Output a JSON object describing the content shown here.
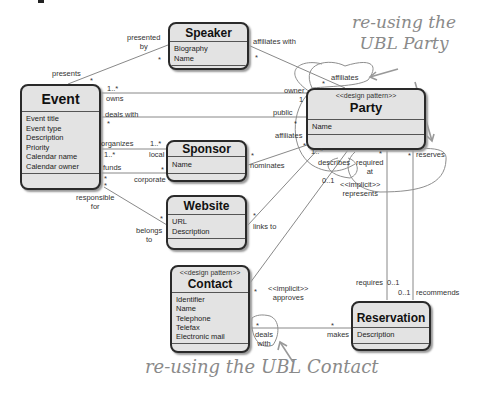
{
  "classes": {
    "speaker": {
      "name": "Speaker",
      "attributes": [
        "Biography",
        "Name"
      ]
    },
    "event": {
      "name": "Event",
      "attributes": [
        "Event title",
        "Event type",
        "Description",
        "Priority",
        "Calendar name",
        "Calendar owner"
      ]
    },
    "sponsor": {
      "name": "Sponsor",
      "attributes": [
        "Name"
      ]
    },
    "website": {
      "name": "Website",
      "attributes": [
        "URL",
        "Description"
      ]
    },
    "party": {
      "stereotype": "<<design pattern>>",
      "name": "Party",
      "attributes": [
        "Name"
      ]
    },
    "contact": {
      "stereotype": "<<design pattern>>",
      "name": "Contact",
      "attributes": [
        "Identifier",
        "Name",
        "Telephone",
        "Telefax",
        "Electronic mail"
      ]
    },
    "reservation": {
      "name": "Reservation",
      "attributes": [
        "Description"
      ]
    }
  },
  "labels": {
    "presented_by": "presented\nby",
    "presents": "presents",
    "affiliates_with": "affiliates with",
    "owns": "owns",
    "deals_with": "deals with",
    "organizes": "organizes",
    "funds": "funds",
    "local": "local",
    "corporate": "corporate",
    "responsible_for": "responsible\nfor",
    "belongs_to": "belongs\nto",
    "nominates": "nominates",
    "links_to": "links to",
    "affiliates_top": "affiliates",
    "owner": "owner",
    "public": "public",
    "affiliates_left": "affiliates",
    "describes": "describes",
    "required_at": "required\nat",
    "reserves": "reserves",
    "implicit_represents": "<<implicit>>\nrepresents",
    "implicit_approves": "<<implicit>>\napproves",
    "requires": "requires",
    "recommends": "recommends",
    "makes": "makes",
    "deals_with_contact": "deals\nwith"
  },
  "multiplicities": {
    "star": "*",
    "one_star": "1..*",
    "one_dot": "1..",
    "one": "1",
    "zero_one": "0..1"
  },
  "annotations": {
    "party_note": "re-using the\nUBL Party",
    "contact_note": "re-using the UBL Contact"
  }
}
